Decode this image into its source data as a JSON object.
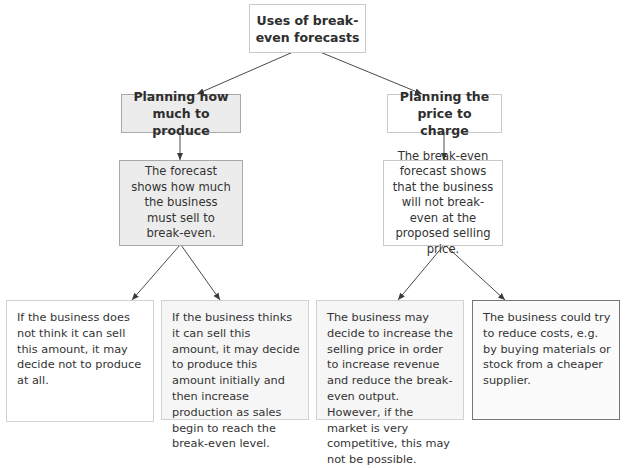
{
  "diagram": {
    "type": "flowchart",
    "root": {
      "id": "uses",
      "label": "Uses of break-even forecasts"
    },
    "branches": [
      {
        "id": "produce",
        "label": "Planning how much to produce",
        "finding": "The forecast shows how much the business must sell to break-even.",
        "outcomes": [
          "If the business does not think it can sell this amount, it may decide not to produce at all.",
          "If the business thinks it can sell this amount, it may decide to produce this amount initially and then increase production as sales begin to reach the break-even level."
        ]
      },
      {
        "id": "price",
        "label": "Planning the price to charge",
        "finding": "The break-even forecast shows that the business will not break-even at the proposed selling price.",
        "outcomes": [
          "The business may decide to increase the selling price in order to increase revenue and reduce the break-even output. However, if the market is very competitive, this may not be possible.",
          "The business could try to reduce costs, e.g. by buying materials or stock from a cheaper supplier."
        ]
      }
    ],
    "colors": {
      "line": "#4a4a4a",
      "gray_fill": "#ececec",
      "border": "#c9c9c9"
    }
  }
}
